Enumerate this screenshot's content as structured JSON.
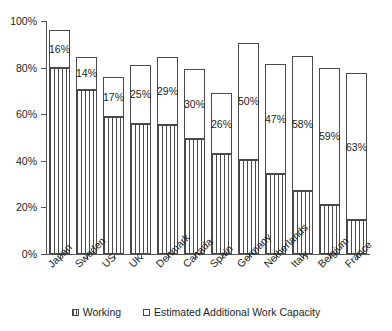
{
  "chart_data": {
    "type": "bar",
    "stacked": true,
    "title": "",
    "subtitle": "",
    "xlabel": "",
    "ylabel": "",
    "ylim": [
      0,
      100
    ],
    "yticks": [
      "0%",
      "20%",
      "40%",
      "60%",
      "80%",
      "100%"
    ],
    "ytick_values": [
      0,
      20,
      40,
      60,
      80,
      100
    ],
    "grid": false,
    "legend_position": "bottom-center",
    "categories": [
      "Japan",
      "Sweden",
      "US",
      "UK",
      "Denmark",
      "Canada",
      "Spain",
      "Germany",
      "Netherlands",
      "Italy",
      "Belgium",
      "France"
    ],
    "series": [
      {
        "name": "Working",
        "values": [
          80,
          70.5,
          59,
          56,
          55.5,
          49.5,
          43,
          40.5,
          34.5,
          27,
          21,
          14.5
        ],
        "fill": "vertical-hatch",
        "color": "#ffffff",
        "edge_color": "#4a4a4a"
      },
      {
        "name": "Estimated Additional Work Capacity",
        "values": [
          16,
          14,
          17,
          25,
          29,
          30,
          26,
          50,
          47,
          58,
          59,
          63
        ],
        "fill": "solid",
        "color": "#ffffff",
        "edge_color": "#4a4a4a",
        "data_labels": [
          "16%",
          "14%",
          "17%",
          "25%",
          "29%",
          "30%",
          "26%",
          "50%",
          "47%",
          "58%",
          "59%",
          "63%"
        ]
      }
    ],
    "totals": [
      96,
      84.5,
      76,
      81,
      84.5,
      79.5,
      69,
      90.5,
      81.5,
      85,
      80,
      77.5
    ]
  },
  "axis": {
    "y_tick_labels": [
      "100%",
      "80%",
      "60%",
      "40%",
      "20%",
      "0%"
    ]
  },
  "legend": {
    "items": [
      {
        "label": "Working",
        "swatch": "hatched-swatch-icon"
      },
      {
        "label": "Estimated Additional Work Capacity",
        "swatch": "empty-swatch-icon"
      }
    ]
  }
}
